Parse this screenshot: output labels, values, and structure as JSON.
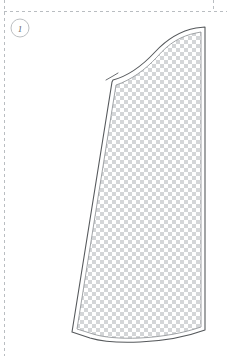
{
  "canvas": {
    "width": 227,
    "height": 356,
    "background": "#ffffff"
  },
  "colors": {
    "guide_dash": "#b9bdc1",
    "piece_outline": "#56595c",
    "seam_line": "#8a8e92",
    "fill_checker_a": "#ffffff",
    "fill_checker_b": "#d4d6d8",
    "label_circle_stroke": "#bcbfc2",
    "label_text": "#5d6063",
    "notch_line": "#6b6e71"
  },
  "layout_guides": {
    "name": "cut-layout-guides",
    "top_rule": {
      "y": 11,
      "x1": 4,
      "x2": 227,
      "style": "dashed"
    },
    "left_rule": {
      "x": 4,
      "y1": 0,
      "y2": 356,
      "style": "dashed"
    },
    "right_rule": {
      "x": 213,
      "y1": 0,
      "y2": 11,
      "style": "dashed"
    },
    "dash_pattern": "3 3",
    "dash_width": 1
  },
  "piece_label": {
    "name": "piece-number-badge",
    "number": "1",
    "cx": 20,
    "cy": 28,
    "r": 9
  },
  "pattern_piece": {
    "name": "pattern-piece-panel",
    "id": "1",
    "fill": "checkerboard",
    "checker_cell": 4,
    "cut_line_path": "M 112 82 L 113 80 C 128 76 142 66 155 52 C 168 38 180 31 196 28 L 205 27 L 205 330 C 186 337 162 341 140 342 C 118 343 100 341 90 338 L 72 332 L 112 82 Z",
    "seam_line_path": "M 116 85 C 131 80 145 70 157 57 C 169 43 181 36 196 33 L 201 32 L 201 327 C 184 333 161 337 140 338 C 119 339 102 337 93 334 L 77 329 L 116 85 Z",
    "top_seam_curve": "M 113 81 C 128 77 142 67 155 53 C 168 39 180 32 196 29 L 205 27",
    "top_seam_inner_curve": "M 117 86 C 132 81 146 71 158 58 C 170 44 182 37 196 34 L 203 33",
    "left_edge": "M 112 82 L 72 332",
    "left_edge_inner": "M 116 86 L 77 329",
    "right_edge": "M 205 27 L 205 330",
    "right_edge_inner": "M 201 32 L 201 327",
    "bottom_edge": "M 72 332 L 90 338 C 100 341 118 343 140 342 C 162 341 186 337 205 330",
    "bottom_edge_inner": "M 77 329 L 93 334 C 102 337 119 339 140 338 C 161 337 184 333 201 327",
    "notch": {
      "name": "seam-notch",
      "path": "M 110 77 L 120 72 M 112 82 L 112 75",
      "corner_path": "M 106 80 L 113 76 L 118 73"
    }
  }
}
